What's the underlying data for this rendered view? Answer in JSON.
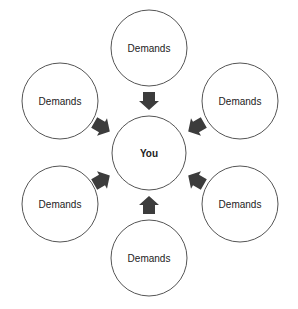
{
  "diagram": {
    "center": {
      "label": "You"
    },
    "nodes": [
      {
        "id": "top",
        "label": "Demands"
      },
      {
        "id": "upper-left",
        "label": "Demands"
      },
      {
        "id": "upper-right",
        "label": "Demands"
      },
      {
        "id": "lower-left",
        "label": "Demands"
      },
      {
        "id": "lower-right",
        "label": "Demands"
      },
      {
        "id": "bottom",
        "label": "Demands"
      }
    ],
    "arrow_color": "#3c3c3c",
    "stroke_color": "#555555"
  }
}
